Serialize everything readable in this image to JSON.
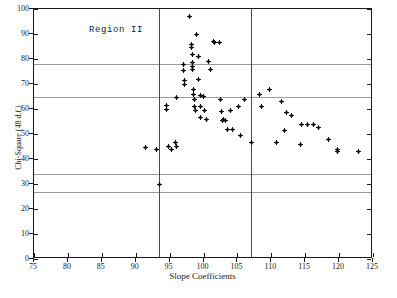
{
  "chart_data": {
    "type": "scatter",
    "title": "",
    "annotation": "Region II",
    "xlabel": "Slope Coefficients",
    "ylabel": "Chi-Square (48 d.f.)",
    "xlim": [
      75,
      125
    ],
    "ylim": [
      0,
      100
    ],
    "xticks": [
      75,
      80,
      85,
      90,
      95,
      100,
      105,
      110,
      115,
      120,
      125
    ],
    "yticks": [
      0,
      10,
      20,
      30,
      40,
      50,
      60,
      70,
      80,
      90,
      100
    ],
    "grid": true,
    "gridlines_h": [
      78.0,
      65.0,
      34.0,
      27.0
    ],
    "gridlines_v": [
      93.5,
      107.0
    ],
    "legend": "none",
    "marker": "plus",
    "marker_color": "#111111",
    "points": [
      [
        91.5,
        44.5
      ],
      [
        93.0,
        44.0
      ],
      [
        93.5,
        30.0
      ],
      [
        94.5,
        61.5
      ],
      [
        94.5,
        60.0
      ],
      [
        94.8,
        45.0
      ],
      [
        95.2,
        44.0
      ],
      [
        95.8,
        46.5
      ],
      [
        96.0,
        64.5
      ],
      [
        96.0,
        45.0
      ],
      [
        97.0,
        78.0
      ],
      [
        97.0,
        75.5
      ],
      [
        97.2,
        71.5
      ],
      [
        97.2,
        70.0
      ],
      [
        98.0,
        97.0
      ],
      [
        98.2,
        86.0
      ],
      [
        98.2,
        84.5
      ],
      [
        98.3,
        82.0
      ],
      [
        98.4,
        78.5
      ],
      [
        98.4,
        77.0
      ],
      [
        98.4,
        76.0
      ],
      [
        98.5,
        68.0
      ],
      [
        98.5,
        66.0
      ],
      [
        98.6,
        64.0
      ],
      [
        98.7,
        61.0
      ],
      [
        98.8,
        59.5
      ],
      [
        99.0,
        90.0
      ],
      [
        99.2,
        81.0
      ],
      [
        99.3,
        72.0
      ],
      [
        99.5,
        65.5
      ],
      [
        99.5,
        61.0
      ],
      [
        99.5,
        56.5
      ],
      [
        100.0,
        65.0
      ],
      [
        100.2,
        59.5
      ],
      [
        100.5,
        56.0
      ],
      [
        100.8,
        79.0
      ],
      [
        101.0,
        76.0
      ],
      [
        101.5,
        87.0
      ],
      [
        101.6,
        86.5
      ],
      [
        102.3,
        86.5
      ],
      [
        102.5,
        64.0
      ],
      [
        102.6,
        59.0
      ],
      [
        102.8,
        55.5
      ],
      [
        103.0,
        56.0
      ],
      [
        103.3,
        55.5
      ],
      [
        103.5,
        52.0
      ],
      [
        104.0,
        59.5
      ],
      [
        104.2,
        52.0
      ],
      [
        105.2,
        61.0
      ],
      [
        105.5,
        49.5
      ],
      [
        106.0,
        64.0
      ],
      [
        107.0,
        46.5
      ],
      [
        108.3,
        66.0
      ],
      [
        108.5,
        61.0
      ],
      [
        109.8,
        68.0
      ],
      [
        110.8,
        46.5
      ],
      [
        111.5,
        63.0
      ],
      [
        112.0,
        51.5
      ],
      [
        112.3,
        58.5
      ],
      [
        113.0,
        57.5
      ],
      [
        114.3,
        46.0
      ],
      [
        114.5,
        54.0
      ],
      [
        115.3,
        54.0
      ],
      [
        116.2,
        54.0
      ],
      [
        117.0,
        52.5
      ],
      [
        118.5,
        48.0
      ],
      [
        119.8,
        44.0
      ],
      [
        119.8,
        43.0
      ],
      [
        122.8,
        43.0
      ]
    ]
  }
}
